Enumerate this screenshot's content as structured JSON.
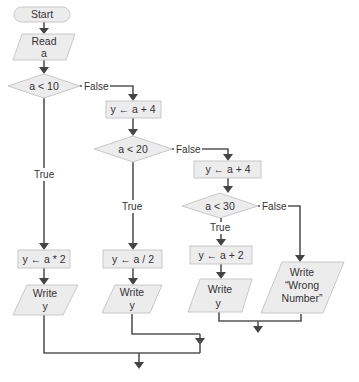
{
  "flowchart": {
    "start": {
      "label": "Start"
    },
    "read": {
      "line1": "Read",
      "line2": "a"
    },
    "decision1": {
      "label": "a < 10",
      "false_label": "False",
      "true_label": "True"
    },
    "process_a_plus_4_first": {
      "label": "y ← a + 4"
    },
    "decision2": {
      "label": "a < 20",
      "false_label": "False",
      "true_label": "True"
    },
    "process_a_plus_4_second": {
      "label": "y ← a + 4"
    },
    "decision3": {
      "label": "a < 30",
      "false_label": "False",
      "true_label": "True"
    },
    "process_a_times_2": {
      "label": "y ← a * 2"
    },
    "process_a_div_2": {
      "label": "y ← a / 2"
    },
    "process_a_plus_2": {
      "label": "y ← a + 2"
    },
    "write1": {
      "line1": "Write",
      "line2": "y"
    },
    "write2": {
      "line1": "Write",
      "line2": "y"
    },
    "write3": {
      "line1": "Write",
      "line2": "y"
    },
    "write_wrong": {
      "line1": "Write",
      "line2": "“Wrong",
      "line3": "Number”"
    }
  },
  "colors": {
    "shape_fill": "#ececec",
    "shape_stroke": "#c8c8c8",
    "connector": "#555555",
    "text": "#333333"
  }
}
